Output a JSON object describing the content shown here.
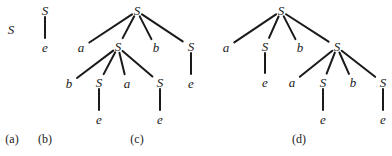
{
  "figure": {
    "panels": [
      {
        "id": "a",
        "caption": "(a)",
        "caption_pos": [
          12,
          143
        ],
        "nodes": [
          {
            "label": "S",
            "x": 11,
            "y": 34
          }
        ],
        "edges": []
      },
      {
        "id": "b",
        "caption": "(b)",
        "caption_pos": [
          45,
          143
        ],
        "nodes": [
          {
            "label": "S",
            "x": 45,
            "y": 15
          },
          {
            "label": "e",
            "x": 45,
            "y": 52
          }
        ],
        "edges": [
          [
            0,
            1
          ]
        ]
      },
      {
        "id": "c",
        "caption": "(c)",
        "caption_pos": [
          137,
          143
        ],
        "nodes": [
          {
            "label": "S",
            "x": 137,
            "y": 15
          },
          {
            "label": "a",
            "x": 81,
            "y": 52
          },
          {
            "label": "S",
            "x": 118,
            "y": 51
          },
          {
            "label": "b",
            "x": 156,
            "y": 52
          },
          {
            "label": "S",
            "x": 191,
            "y": 51
          },
          {
            "label": "e",
            "x": 191,
            "y": 88
          },
          {
            "label": "b",
            "x": 69,
            "y": 88
          },
          {
            "label": "S",
            "x": 99,
            "y": 87
          },
          {
            "label": "a",
            "x": 127,
            "y": 88
          },
          {
            "label": "S",
            "x": 160,
            "y": 87
          },
          {
            "label": "e",
            "x": 99,
            "y": 124
          },
          {
            "label": "e",
            "x": 160,
            "y": 124
          }
        ],
        "edges": [
          [
            0,
            1
          ],
          [
            0,
            2
          ],
          [
            0,
            3
          ],
          [
            0,
            4
          ],
          [
            4,
            5
          ],
          [
            2,
            6
          ],
          [
            2,
            7
          ],
          [
            2,
            8
          ],
          [
            2,
            9
          ],
          [
            7,
            10
          ],
          [
            9,
            11
          ]
        ]
      },
      {
        "id": "d",
        "caption": "(d)",
        "caption_pos": [
          299,
          143
        ],
        "nodes": [
          {
            "label": "S",
            "x": 281,
            "y": 15
          },
          {
            "label": "a",
            "x": 226,
            "y": 52
          },
          {
            "label": "S",
            "x": 265,
            "y": 51
          },
          {
            "label": "b",
            "x": 300,
            "y": 52
          },
          {
            "label": "S",
            "x": 337,
            "y": 51
          },
          {
            "label": "e",
            "x": 265,
            "y": 87
          },
          {
            "label": "a",
            "x": 292,
            "y": 87
          },
          {
            "label": "S",
            "x": 323,
            "y": 87
          },
          {
            "label": "b",
            "x": 353,
            "y": 87
          },
          {
            "label": "S",
            "x": 383,
            "y": 87
          },
          {
            "label": "e",
            "x": 323,
            "y": 124
          },
          {
            "label": "e",
            "x": 383,
            "y": 124
          }
        ],
        "edges": [
          [
            0,
            1
          ],
          [
            0,
            2
          ],
          [
            0,
            3
          ],
          [
            0,
            4
          ],
          [
            2,
            5
          ],
          [
            4,
            6
          ],
          [
            4,
            7
          ],
          [
            4,
            8
          ],
          [
            4,
            9
          ],
          [
            7,
            10
          ],
          [
            9,
            11
          ]
        ]
      }
    ]
  }
}
